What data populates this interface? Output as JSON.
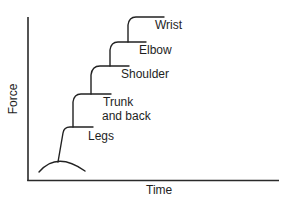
{
  "diagram": {
    "type": "kinetic-chain-force-summation",
    "axes": {
      "y_label": "Force",
      "x_label": "Time"
    },
    "segments": [
      {
        "id": "legs",
        "label_lines": [
          "Legs"
        ]
      },
      {
        "id": "trunk",
        "label_lines": [
          "Trunk",
          "and back"
        ]
      },
      {
        "id": "shoulder",
        "label_lines": [
          "Shoulder"
        ]
      },
      {
        "id": "elbow",
        "label_lines": [
          "Elbow"
        ]
      },
      {
        "id": "wrist",
        "label_lines": [
          "Wrist"
        ]
      }
    ],
    "colors": {
      "line": "#222222",
      "text": "#1e1e1e",
      "background": "#ffffff"
    }
  }
}
